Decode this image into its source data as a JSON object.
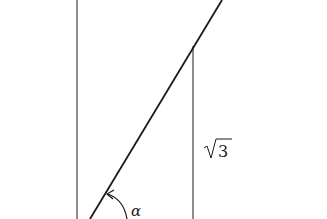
{
  "diagram": {
    "labels": {
      "side_label": "3",
      "side_label_radical": "√",
      "angle_label": "α"
    },
    "colors": {
      "stroke": "#1a1a1a",
      "background": "#ffffff"
    },
    "elements": {
      "left_vertical": {
        "x": 77,
        "y1": 0,
        "y2": 219
      },
      "right_vertical": {
        "x": 193,
        "y1": 46,
        "y2": 219
      },
      "diagonal": {
        "x1": 90,
        "y1": 219,
        "x2": 222,
        "y2": 0
      }
    }
  }
}
